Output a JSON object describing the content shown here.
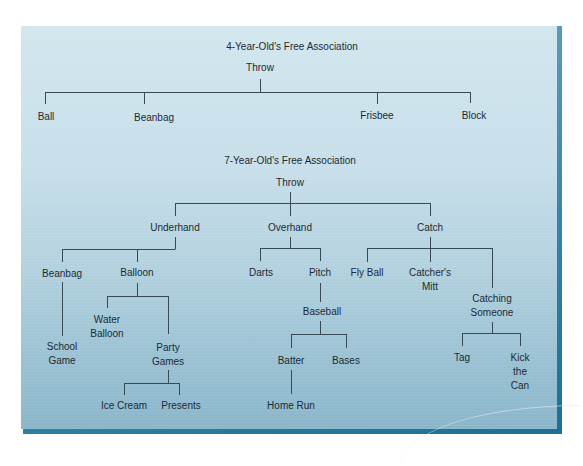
{
  "diagrams": [
    {
      "title": "4-Year-Old's Free Association",
      "root": "Throw",
      "children": [
        "Ball",
        "Beanbag",
        "Frisbee",
        "Block"
      ]
    },
    {
      "title": "7-Year-Old's Free Association",
      "root": "Throw",
      "branches": {
        "underhand": {
          "label": "Underhand",
          "beanbag": {
            "label": "Beanbag",
            "child": [
              "School",
              "Game"
            ]
          },
          "balloon": {
            "label": "Balloon",
            "water_balloon": [
              "Water",
              "Balloon"
            ],
            "party_games": {
              "label": [
                "Party",
                "Games"
              ],
              "children": [
                "Ice Cream",
                "Presents"
              ]
            }
          }
        },
        "overhand": {
          "label": "Overhand",
          "darts": "Darts",
          "pitch": {
            "label": "Pitch",
            "baseball": {
              "label": "Baseball",
              "batter": {
                "label": "Batter",
                "child": "Home Run"
              },
              "bases": "Bases"
            }
          }
        },
        "catch": {
          "label": "Catch",
          "fly_ball": "Fly Ball",
          "catchers_mitt": [
            "Catcher's",
            "Mitt"
          ],
          "catching_someone": {
            "label": [
              "Catching",
              "Someone"
            ],
            "tag": "Tag",
            "kick_the_can": [
              "Kick",
              "the",
              "Can"
            ]
          }
        }
      }
    }
  ],
  "colors": {
    "panel_top": "#d2e6ee",
    "panel_bottom": "#8ab6ca",
    "bevel": "#2f7ea3",
    "line": "#3a4a55",
    "text": "#1d2a33"
  }
}
